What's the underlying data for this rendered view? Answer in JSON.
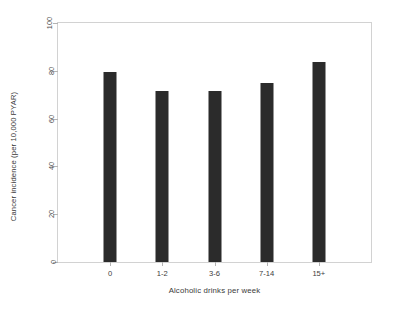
{
  "chart_data": {
    "type": "bar",
    "title": "",
    "subtitle": "",
    "xlabel": "Alcoholic drinks per week",
    "ylabel": "Cancer incidence (per 10,000 PYAR)",
    "categories": [
      "0",
      "1-2",
      "3-6",
      "7-14",
      "15+"
    ],
    "values": [
      79.5,
      71.5,
      71.5,
      75,
      83.5
    ],
    "ylim": [
      0,
      100
    ],
    "yticks": [
      0,
      20,
      40,
      60,
      80,
      100
    ],
    "ytick_labels": [
      "0",
      "20",
      "40",
      "60",
      "80",
      "100"
    ],
    "grid": false,
    "legend": null,
    "bar_color": "#2b2b2b",
    "frame_color": "#d2d2d2",
    "background": "#ffffff",
    "annotations": []
  }
}
